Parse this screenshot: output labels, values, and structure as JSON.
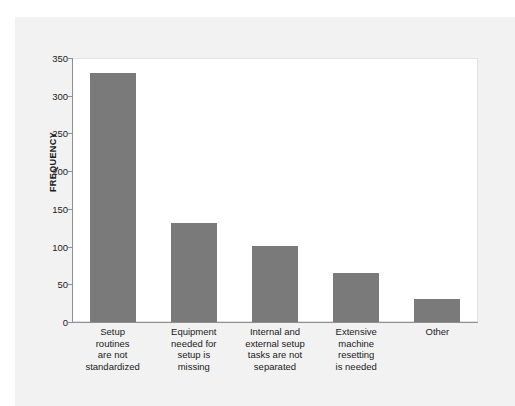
{
  "chart_data": {
    "type": "bar",
    "title": "",
    "xlabel": "",
    "ylabel": "FREQUENCY",
    "ylim": [
      0,
      350
    ],
    "ytick_step": 50,
    "yticks": [
      0,
      50,
      100,
      150,
      200,
      250,
      300,
      350
    ],
    "grid": false,
    "legend": null,
    "bar_color": "#7a7a7a",
    "panel_color": "#f2f2f2",
    "plot_background": "#ffffff",
    "axis_color": "#8f8f8f",
    "text_color": "#1a1a1a",
    "categories": [
      "Setup routines are not standardized",
      "Equipment needed for setup is missing",
      "Internal and external setup tasks are not separated",
      "Extensive machine resetting is needed",
      "Other"
    ],
    "category_lines": [
      [
        "Setup",
        "routines",
        "are not",
        "standardized"
      ],
      [
        "Equipment",
        "needed for",
        "setup is",
        "missing"
      ],
      [
        "Internal and",
        "external setup",
        "tasks are not",
        "separated"
      ],
      [
        "Extensive",
        "machine",
        "resetting",
        "is needed"
      ],
      [
        "Other"
      ]
    ],
    "values": [
      330,
      131,
      101,
      65,
      30
    ]
  }
}
